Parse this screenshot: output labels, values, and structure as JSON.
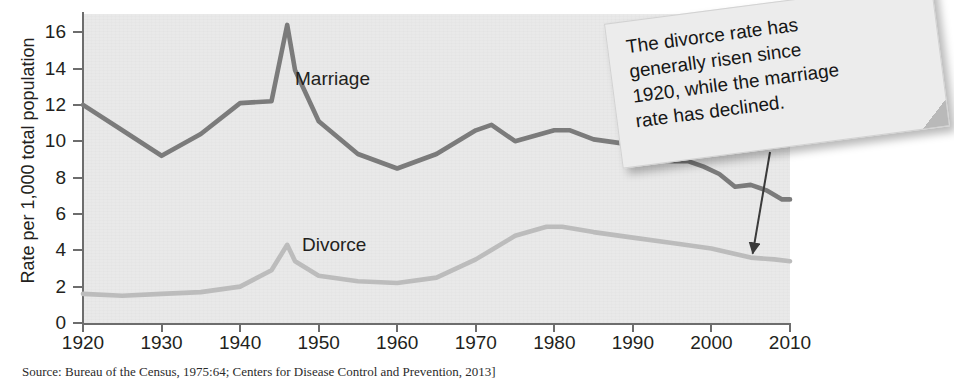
{
  "chart_data": {
    "type": "line",
    "title": "",
    "xlabel": "",
    "ylabel": "Rate per 1,000 total population",
    "xlim": [
      1920,
      2010
    ],
    "ylim": [
      0,
      17
    ],
    "xticks": [
      "1920",
      "1930",
      "1940",
      "1950",
      "1960",
      "1970",
      "1980",
      "1990",
      "2000",
      "2010"
    ],
    "yticks": [
      "0",
      "2",
      "4",
      "6",
      "8",
      "10",
      "12",
      "14",
      "16"
    ],
    "grid": false,
    "legend_position": "inline-labels",
    "series": [
      {
        "name": "Marriage",
        "color": "#7b7b7b",
        "x": [
          1920,
          1925,
          1930,
          1935,
          1940,
          1944,
          1946,
          1947,
          1950,
          1955,
          1960,
          1965,
          1970,
          1972,
          1975,
          1980,
          1982,
          1985,
          1990,
          1993,
          1995,
          1997,
          1999,
          2001,
          2003,
          2005,
          2007,
          2009,
          2010
        ],
        "values": [
          12.0,
          10.6,
          9.2,
          10.4,
          12.1,
          12.2,
          16.4,
          13.9,
          11.1,
          9.3,
          8.5,
          9.3,
          10.6,
          10.9,
          10.0,
          10.6,
          10.6,
          10.1,
          9.8,
          9.0,
          8.9,
          8.9,
          8.6,
          8.2,
          7.5,
          7.6,
          7.3,
          6.8,
          6.8
        ]
      },
      {
        "name": "Divorce",
        "color": "#bcbcbc",
        "x": [
          1920,
          1925,
          1930,
          1935,
          1940,
          1944,
          1946,
          1947,
          1950,
          1955,
          1960,
          1965,
          1970,
          1975,
          1979,
          1981,
          1985,
          1990,
          1995,
          2000,
          2005,
          2008,
          2010
        ],
        "values": [
          1.6,
          1.5,
          1.6,
          1.7,
          2.0,
          2.9,
          4.3,
          3.4,
          2.6,
          2.3,
          2.2,
          2.5,
          3.5,
          4.8,
          5.3,
          5.3,
          5.0,
          4.7,
          4.4,
          4.1,
          3.6,
          3.5,
          3.4
        ]
      }
    ],
    "annotations": [
      {
        "name": "divorce-marriage-callout",
        "lines": [
          "The divorce rate has",
          "generally risen since",
          "1920, while the marriage",
          "rate has declined."
        ],
        "arrow_to_year": 2005,
        "arrow_to_value": 3.6
      }
    ],
    "source": "Source:  Bureau of the Census, 1975:64; Centers for Disease Control and Prevention, 2013]"
  },
  "series_labels": {
    "marriage": "Marriage",
    "divorce": "Divorce"
  }
}
